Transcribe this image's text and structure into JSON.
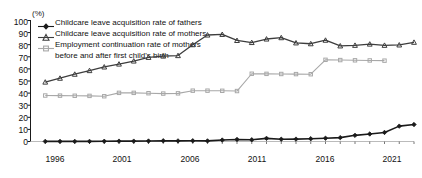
{
  "axis": {
    "unit_label": "(%)",
    "y_ticks": [
      "100",
      "90",
      "80",
      "70",
      "60",
      "50",
      "40",
      "30",
      "20",
      "10",
      "0"
    ],
    "x_ticks": [
      "1996",
      "2001",
      "2006",
      "2011",
      "2016",
      "2021"
    ],
    "y_min": 0,
    "y_max": 100,
    "x_min": 1995,
    "x_max": 2021
  },
  "legend": {
    "items": [
      {
        "label": "Childcare leave acquisition rate of fathers",
        "marker": "filled-diamond-marker",
        "color": "#1a1a1a"
      },
      {
        "label": "Childcare leave acquisition rate of mothers",
        "marker": "triangle-marker",
        "color": "#3d3d3d"
      },
      {
        "label": "Employment continuation rate of mothers\nbefore and after first child's birth",
        "marker": "square-marker",
        "color": "#a8a8a8"
      }
    ]
  },
  "chart_data": {
    "type": "line",
    "title": "",
    "subtitle": "",
    "xlabel": "",
    "ylabel": "(%)",
    "xlim": [
      1995,
      2021
    ],
    "ylim": [
      0,
      100
    ],
    "grid": false,
    "legend_position": "top-left",
    "x": [
      1996,
      1997,
      1998,
      1999,
      2000,
      2001,
      2002,
      2003,
      2004,
      2005,
      2006,
      2007,
      2008,
      2009,
      2010,
      2011,
      2012,
      2013,
      2014,
      2015,
      2016,
      2017,
      2018,
      2019,
      2020,
      2021
    ],
    "series": [
      {
        "name": "Childcare leave acquisition rate of fathers",
        "color": "#1a1a1a",
        "marker": "filled-diamond-marker",
        "values": [
          0.1,
          0.1,
          0.1,
          0.1,
          0.2,
          0.3,
          0.3,
          0.4,
          0.6,
          0.5,
          0.6,
          0.5,
          1.2,
          1.7,
          1.4,
          2.6,
          1.9,
          2.0,
          2.3,
          2.7,
          3.2,
          5.1,
          6.2,
          7.5,
          12.7,
          14.0
        ]
      },
      {
        "name": "Childcare leave acquisition rate of mothers",
        "color": "#3d3d3d",
        "marker": "triangle-marker",
        "values": [
          49.1,
          52.3,
          55.6,
          58.6,
          61.6,
          64.0,
          66.5,
          69.5,
          70.6,
          71.0,
          80.0,
          88.0,
          88.5,
          83.5,
          81.8,
          84.7,
          85.8,
          81.5,
          80.8,
          83.7,
          79.0,
          79.5,
          80.5,
          79.5,
          79.8,
          82.0
        ]
      },
      {
        "name": "Employment continuation rate of mothers before and after first child's birth",
        "color": "#a8a8a8",
        "marker": "square-marker",
        "values": [
          38.0,
          37.9,
          37.8,
          37.7,
          37.4,
          40.2,
          40.2,
          39.9,
          39.6,
          39.8,
          42.0,
          42.0,
          41.9,
          41.7,
          56.0,
          55.9,
          55.8,
          55.7,
          55.6,
          67.5,
          67.3,
          67.1,
          67.0,
          66.8,
          null,
          null
        ]
      }
    ]
  }
}
